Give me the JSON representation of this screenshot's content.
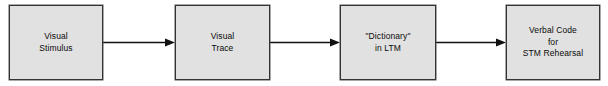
{
  "diagram": {
    "type": "flowchart",
    "orientation": "horizontal",
    "background_color": "#ffffff",
    "box_fill_color": "#e1e1e1",
    "box_border_color": "#333333",
    "text_color": "#0a0a0a",
    "arrow_color": "#111111",
    "nodes": [
      {
        "id": "visual-stimulus",
        "lines": [
          "Visual",
          "Stimulus"
        ],
        "x": 9,
        "y": 5,
        "width": 94,
        "height": 75
      },
      {
        "id": "visual-trace",
        "lines": [
          "Visual",
          "Trace"
        ],
        "x": 175,
        "y": 5,
        "width": 95,
        "height": 75
      },
      {
        "id": "dictionary-in-ltm",
        "lines": [
          "\"Dictionary\"",
          "in LTM"
        ],
        "x": 340,
        "y": 5,
        "width": 96,
        "height": 75
      },
      {
        "id": "verbal-code-stm-rehearsal",
        "lines": [
          "Verbal Code",
          "for",
          "STM Rehearsal"
        ],
        "x": 506,
        "y": 5,
        "width": 94,
        "height": 75
      }
    ],
    "connectors": [
      {
        "id": "arrow-stimulus-to-trace",
        "from": "visual-stimulus",
        "to": "visual-trace",
        "x": 103,
        "y": 37,
        "width": 72
      },
      {
        "id": "arrow-trace-to-dictionary",
        "from": "visual-trace",
        "to": "dictionary-in-ltm",
        "x": 270,
        "y": 37,
        "width": 70
      },
      {
        "id": "arrow-dictionary-to-verbal-code",
        "from": "dictionary-in-ltm",
        "to": "verbal-code-stm-rehearsal",
        "x": 436,
        "y": 37,
        "width": 70
      }
    ]
  }
}
